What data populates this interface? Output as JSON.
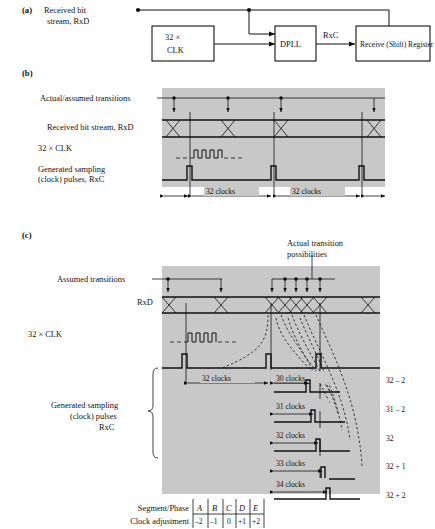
{
  "figure": {
    "title_absent": true,
    "panels": [
      {
        "key": "a",
        "label": "(a)",
        "signal_label_line1": "Received bit",
        "signal_label_line2": "stream, RxD",
        "blocks": [
          {
            "name": "clock-divider-block",
            "line1": "32 ×",
            "line2": "CLK"
          },
          {
            "name": "dpll-block",
            "line1": "DPLL",
            "line2": ""
          },
          {
            "name": "receive-shift-register-block",
            "line1": "Receive (Shift) Register",
            "line2": ""
          }
        ],
        "wire_labels": [
          "RxC"
        ]
      },
      {
        "key": "b",
        "label": "(b)",
        "row_labels": [
          "Actual/assumed transitions",
          "Received bit stream, RxD",
          "32 × CLK",
          "Generated sampling",
          " (clock) pulses, RxC"
        ],
        "interval_labels": [
          "32 clocks",
          "32 clocks"
        ]
      },
      {
        "key": "c",
        "label": "(c)",
        "callout_line1": "Actual transition",
        "callout_line2": "possibilities",
        "row_labels": [
          "Assumed transitions",
          "RxD",
          "32 × CLK",
          "Generated sampling",
          "(clock) pulses",
          "RxC"
        ],
        "interval_labels": [
          "32 clocks",
          "30 clocks",
          "31 clocks",
          "32 clocks",
          "33 clocks",
          "34 clocks"
        ],
        "right_labels": [
          "32 – 2",
          "31 – 2",
          "32",
          "32 + 1",
          "32 + 2"
        ],
        "table": {
          "row_headers": [
            "Segment/Phase",
            "Clock adjustment"
          ],
          "segments": [
            "A",
            "B",
            "C",
            "D",
            "E"
          ],
          "adjustments": [
            "–2",
            "–1",
            "0",
            "+1",
            "+2"
          ]
        }
      }
    ]
  },
  "colors": {
    "panel_gray": "#c8c8c8",
    "ink": "#111111",
    "paper": "#ffffff"
  }
}
